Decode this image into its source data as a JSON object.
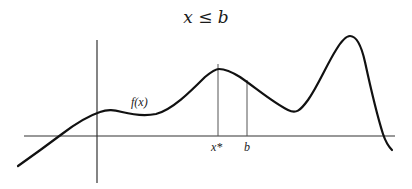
{
  "diagram": {
    "title": "x ≤ b",
    "function_label": "f(x)",
    "tick_labels": {
      "x_star": "x*",
      "b": "b"
    },
    "colors": {
      "curve": "#111111",
      "axes": "#333333",
      "guides": "#555555"
    }
  }
}
